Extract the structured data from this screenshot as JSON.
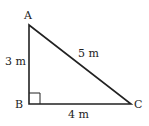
{
  "diagram": {
    "type": "right-triangle",
    "vertices": {
      "A": {
        "label": "A",
        "x": 29,
        "y": 25
      },
      "B": {
        "label": "B",
        "x": 29,
        "y": 104
      },
      "C": {
        "label": "C",
        "x": 131,
        "y": 104
      }
    },
    "sides": {
      "AB": {
        "label": "3 m"
      },
      "AC": {
        "label": "5 m"
      },
      "BC": {
        "label": "4 m"
      }
    },
    "right_angle_at": "B",
    "stroke_color": "#222222"
  }
}
